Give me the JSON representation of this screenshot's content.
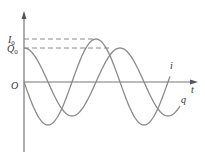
{
  "diagram": {
    "type": "line",
    "axes": {
      "x_label": "t",
      "y_labels": {
        "I0": "I",
        "I0_sub": "0",
        "Q0": "Q",
        "Q0_sub": "0"
      },
      "origin_label": "O"
    },
    "series": [
      {
        "name": "i",
        "label": "i",
        "amplitude_label": "I0",
        "form": "-I0*sin(wt)",
        "amplitude_px": 43
      },
      {
        "name": "q",
        "label": "q",
        "amplitude_label": "Q0",
        "form": "Q0*cos(wt)",
        "amplitude_px": 34
      }
    ],
    "colors": {
      "axis": "#777777",
      "curve": "#8a8a8a",
      "dashed": "#8a8a8a",
      "text": "#333333"
    }
  },
  "chart_data": {
    "type": "line",
    "title": "",
    "xlabel": "t",
    "ylabel": "",
    "y_ticks": [
      "I0",
      "Q0"
    ],
    "series": [
      {
        "name": "i",
        "function": "-I0 sin(ωt)",
        "amplitude": "I0",
        "periods_shown": 1.5
      },
      {
        "name": "q",
        "function": "Q0 cos(ωt)",
        "amplitude": "Q0",
        "periods_shown": 1.6
      }
    ],
    "relation": "I0 > Q0 (as drawn); q leads i by a quarter period"
  }
}
